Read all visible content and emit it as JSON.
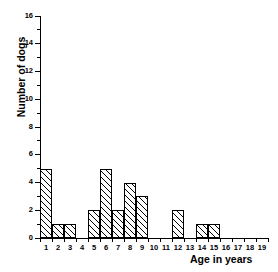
{
  "chart_data": {
    "type": "bar",
    "title": "",
    "subtitle": "",
    "xlabel": "Age in years",
    "ylabel": "Number of dogs",
    "categories": [
      "1",
      "2",
      "3",
      "4",
      "5",
      "6",
      "7",
      "8",
      "9",
      "10",
      "11",
      "12",
      "13",
      "14",
      "15",
      "16",
      "17",
      "18",
      "19"
    ],
    "values": [
      5,
      1,
      1,
      0,
      2,
      5,
      2,
      4,
      3,
      0,
      0,
      2,
      0,
      1,
      1,
      0,
      0,
      0,
      0
    ],
    "xlim": [
      0.5,
      19.5
    ],
    "ylim": [
      0,
      16
    ],
    "ytick_labels": [
      "0",
      "2",
      "4",
      "6",
      "8",
      "10",
      "12",
      "14",
      "16"
    ],
    "ytick_values": [
      0,
      2,
      4,
      6,
      8,
      10,
      12,
      14,
      16
    ],
    "yminor_values": [
      1,
      3,
      5,
      7,
      9,
      11,
      13,
      15
    ],
    "grid": false,
    "legend": false,
    "legend_position": "none",
    "annotations": [],
    "style": {
      "bar_fill": "#ffffff",
      "bar_edge": "#000000",
      "bar_hatch": "diagonal-forward",
      "axis_color": "#000000",
      "background": "#ffffff"
    }
  }
}
